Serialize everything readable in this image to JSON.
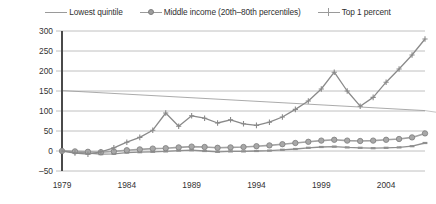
{
  "legend": {
    "position": "top-center",
    "items": [
      {
        "label": "Lowest quintile",
        "marker": "dash-marker-icon",
        "color": "#9a9a9a"
      },
      {
        "label": "Middle income (20th–80th percentiles)",
        "marker": "circle-marker-icon",
        "color": "#9e9e9e"
      },
      {
        "label": "Top 1 percent",
        "marker": "plus-marker-icon",
        "color": "#9a9a9a"
      }
    ]
  },
  "axes": {
    "y_ticks": [
      "300",
      "250",
      "200",
      "150",
      "100",
      "50",
      "0",
      "–50"
    ],
    "x_ticks": [
      "1979",
      "1984",
      "1989",
      "1994",
      "1999",
      "2004"
    ]
  },
  "chart_data": {
    "type": "line",
    "title": "",
    "subtitle": "",
    "xlabel": "",
    "ylabel": "",
    "xlim": [
      1979,
      2007
    ],
    "ylim": [
      -50,
      300
    ],
    "grid": true,
    "legend_position": "top-center",
    "x": [
      1979,
      1980,
      1981,
      1982,
      1983,
      1984,
      1985,
      1986,
      1987,
      1988,
      1989,
      1990,
      1991,
      1992,
      1993,
      1994,
      1995,
      1996,
      1997,
      1998,
      1999,
      2000,
      2001,
      2002,
      2003,
      2004,
      2005,
      2006,
      2007
    ],
    "series": [
      {
        "name": "Lowest quintile",
        "marker": "dash-marker-icon",
        "color": "#8f8f8f",
        "values": [
          0,
          -2,
          -5,
          -8,
          -7,
          -4,
          -3,
          -2,
          -1,
          1,
          2,
          0,
          -2,
          -1,
          -1,
          0,
          1,
          3,
          5,
          8,
          10,
          11,
          9,
          8,
          7,
          8,
          9,
          12,
          20
        ]
      },
      {
        "name": "Middle income (20th–80th percentiles)",
        "marker": "circle-marker-icon",
        "color": "#a3a3a3",
        "values": [
          0,
          -1,
          -2,
          -3,
          -1,
          2,
          4,
          6,
          7,
          9,
          11,
          10,
          8,
          9,
          10,
          12,
          14,
          17,
          20,
          23,
          26,
          28,
          26,
          25,
          26,
          28,
          30,
          34,
          44
        ]
      },
      {
        "name": "Top 1 percent",
        "marker": "plus-marker-icon",
        "color": "#8a8a8a",
        "values": [
          0,
          -5,
          -8,
          -2,
          8,
          22,
          34,
          52,
          95,
          62,
          88,
          82,
          70,
          78,
          68,
          64,
          72,
          85,
          104,
          125,
          155,
          197,
          150,
          112,
          134,
          172,
          205,
          240,
          280
        ]
      }
    ],
    "annotations": [
      {
        "name": "scan-fold-artifact-line",
        "from": [
          1979,
          151
        ],
        "to": [
          2007,
          101
        ]
      }
    ]
  }
}
